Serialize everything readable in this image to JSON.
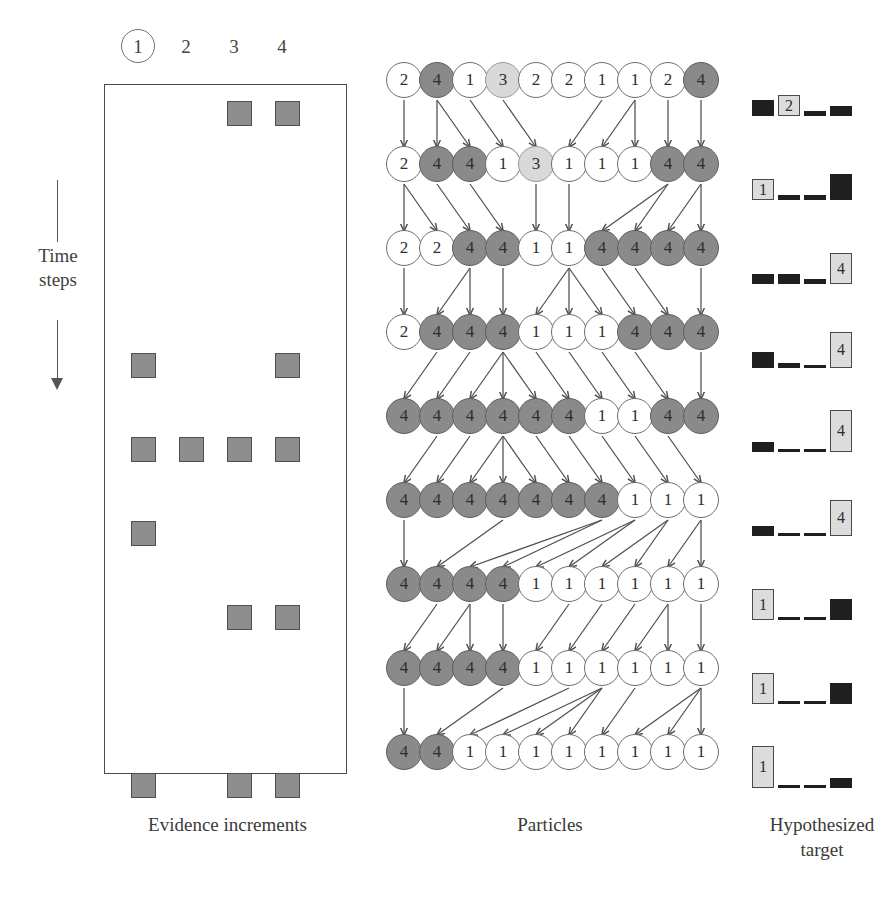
{
  "figure": {
    "columns": [
      {
        "label": "1",
        "circled": true
      },
      {
        "label": "2",
        "circled": false
      },
      {
        "label": "3",
        "circled": false
      },
      {
        "label": "4",
        "circled": false
      }
    ],
    "time_axis_label": "Time\nsteps",
    "time_axis_line1": "Time",
    "time_axis_line2": "steps",
    "captions": {
      "evidence": "Evidence increments",
      "particles": "Particles",
      "hypothesized": "Hypothesized target"
    },
    "colors": {
      "evidence_square_fill": "#8e8e8e",
      "evidence_square_border": "#4f4f4f",
      "particle_white": "#ffffff",
      "particle_dark": "#8a8a8a",
      "particle_light": "#d9d9d9",
      "bar_dark": "#1f1f1f",
      "bar_highlight": "#dcdcdc",
      "box_border": "#4a4a4a",
      "arrow": "#4f4f4f"
    }
  },
  "chart_data": {
    "type": "diagram",
    "n_time_steps": 9,
    "n_particles": 10,
    "n_targets": 4,
    "evidence_increments": {
      "description": "Grid of evidence increment marks; rows are time steps, columns are candidate targets 1-4",
      "columns": [
        "1",
        "2",
        "3",
        "4"
      ],
      "rows": [
        {
          "step": 1,
          "marks": [
            0,
            0,
            1,
            1
          ]
        },
        {
          "step": 2,
          "marks": [
            0,
            0,
            0,
            0
          ]
        },
        {
          "step": 3,
          "marks": [
            0,
            0,
            0,
            0
          ]
        },
        {
          "step": 4,
          "marks": [
            1,
            0,
            0,
            1
          ]
        },
        {
          "step": 5,
          "marks": [
            1,
            1,
            1,
            1
          ]
        },
        {
          "step": 6,
          "marks": [
            1,
            0,
            0,
            0
          ]
        },
        {
          "step": 7,
          "marks": [
            0,
            0,
            1,
            1
          ]
        },
        {
          "step": 8,
          "marks": [
            0,
            0,
            0,
            0
          ]
        },
        {
          "step": 9,
          "marks": [
            1,
            0,
            1,
            1
          ]
        }
      ]
    },
    "particles": {
      "description": "Each row is one time step of 10 particles, each labelled with its hypothesized target id",
      "rows": [
        {
          "step": 1,
          "values": [
            "2",
            "4",
            "1",
            "3",
            "2",
            "2",
            "1",
            "1",
            "2",
            "4"
          ]
        },
        {
          "step": 2,
          "values": [
            "2",
            "4",
            "4",
            "1",
            "3",
            "1",
            "1",
            "1",
            "4",
            "4"
          ]
        },
        {
          "step": 3,
          "values": [
            "2",
            "2",
            "4",
            "4",
            "1",
            "1",
            "4",
            "4",
            "4",
            "4"
          ]
        },
        {
          "step": 4,
          "values": [
            "2",
            "4",
            "4",
            "4",
            "1",
            "1",
            "1",
            "4",
            "4",
            "4"
          ]
        },
        {
          "step": 5,
          "values": [
            "4",
            "4",
            "4",
            "4",
            "4",
            "4",
            "1",
            "1",
            "4",
            "4"
          ]
        },
        {
          "step": 6,
          "values": [
            "4",
            "4",
            "4",
            "4",
            "4",
            "4",
            "4",
            "1",
            "1",
            "1"
          ]
        },
        {
          "step": 7,
          "values": [
            "4",
            "4",
            "4",
            "4",
            "1",
            "1",
            "1",
            "1",
            "1",
            "1"
          ]
        },
        {
          "step": 8,
          "values": [
            "4",
            "4",
            "4",
            "4",
            "1",
            "1",
            "1",
            "1",
            "1",
            "1"
          ]
        },
        {
          "step": 9,
          "values": [
            "4",
            "4",
            "1",
            "1",
            "1",
            "1",
            "1",
            "1",
            "1",
            "1"
          ]
        }
      ]
    },
    "hypothesized_target": {
      "description": "Per time step histogram over the 4 candidate targets; tallest bar is highlighted and labelled",
      "categories": [
        "1",
        "2",
        "3",
        "4"
      ],
      "ylim": [
        0,
        10
      ],
      "rows": [
        {
          "step": 1,
          "values": [
            3,
            4,
            1,
            2
          ],
          "argmax": "2"
        },
        {
          "step": 2,
          "values": [
            4,
            1,
            1,
            5
          ],
          "argmax": "1"
        },
        {
          "step": 3,
          "values": [
            2,
            2,
            1,
            6
          ],
          "argmax": "4"
        },
        {
          "step": 4,
          "values": [
            3,
            1,
            0,
            7
          ],
          "argmax": "4"
        },
        {
          "step": 5,
          "values": [
            2,
            0,
            0,
            8
          ],
          "argmax": "4"
        },
        {
          "step": 6,
          "values": [
            2,
            0,
            0,
            7
          ],
          "argmax": "4"
        },
        {
          "step": 7,
          "values": [
            6,
            0,
            0,
            4
          ],
          "argmax": "1"
        },
        {
          "step": 8,
          "values": [
            6,
            0,
            0,
            4
          ],
          "argmax": "1"
        },
        {
          "step": 9,
          "values": [
            8,
            0,
            0,
            2
          ],
          "argmax": "1"
        }
      ]
    },
    "resampling_arrows": {
      "description": "Arrows between consecutive particle rows showing resampling lineage (parent index -> child index, 0-based)",
      "transitions": [
        {
          "from_step": 1,
          "to_step": 2,
          "edges": [
            [
              0,
              0
            ],
            [
              1,
              1
            ],
            [
              1,
              2
            ],
            [
              2,
              3
            ],
            [
              3,
              4
            ],
            [
              6,
              5
            ],
            [
              7,
              6
            ],
            [
              7,
              7
            ],
            [
              8,
              8
            ],
            [
              9,
              9
            ]
          ]
        },
        {
          "from_step": 2,
          "to_step": 3,
          "edges": [
            [
              0,
              0
            ],
            [
              0,
              1
            ],
            [
              1,
              2
            ],
            [
              2,
              3
            ],
            [
              4,
              4
            ],
            [
              5,
              5
            ],
            [
              8,
              6
            ],
            [
              8,
              7
            ],
            [
              9,
              8
            ],
            [
              9,
              9
            ]
          ]
        },
        {
          "from_step": 3,
          "to_step": 4,
          "edges": [
            [
              0,
              0
            ],
            [
              2,
              1
            ],
            [
              2,
              2
            ],
            [
              3,
              3
            ],
            [
              5,
              4
            ],
            [
              5,
              5
            ],
            [
              5,
              6
            ],
            [
              6,
              7
            ],
            [
              7,
              8
            ],
            [
              9,
              9
            ]
          ]
        },
        {
          "from_step": 4,
          "to_step": 5,
          "edges": [
            [
              1,
              0
            ],
            [
              2,
              1
            ],
            [
              3,
              2
            ],
            [
              3,
              3
            ],
            [
              3,
              4
            ],
            [
              4,
              5
            ],
            [
              5,
              6
            ],
            [
              6,
              7
            ],
            [
              7,
              8
            ],
            [
              9,
              9
            ]
          ]
        },
        {
          "from_step": 5,
          "to_step": 6,
          "edges": [
            [
              1,
              0
            ],
            [
              2,
              1
            ],
            [
              3,
              2
            ],
            [
              3,
              3
            ],
            [
              3,
              4
            ],
            [
              4,
              5
            ],
            [
              5,
              6
            ],
            [
              6,
              7
            ],
            [
              7,
              8
            ],
            [
              8,
              9
            ]
          ]
        },
        {
          "from_step": 6,
          "to_step": 7,
          "edges": [
            [
              0,
              0
            ],
            [
              3,
              1
            ],
            [
              6,
              2
            ],
            [
              6,
              3
            ],
            [
              7,
              4
            ],
            [
              7,
              5
            ],
            [
              8,
              6
            ],
            [
              8,
              7
            ],
            [
              9,
              8
            ],
            [
              9,
              9
            ]
          ]
        },
        {
          "from_step": 7,
          "to_step": 8,
          "edges": [
            [
              1,
              0
            ],
            [
              2,
              1
            ],
            [
              2,
              2
            ],
            [
              3,
              3
            ],
            [
              5,
              4
            ],
            [
              6,
              5
            ],
            [
              7,
              6
            ],
            [
              8,
              7
            ],
            [
              8,
              8
            ],
            [
              9,
              9
            ]
          ]
        },
        {
          "from_step": 8,
          "to_step": 9,
          "edges": [
            [
              0,
              0
            ],
            [
              3,
              1
            ],
            [
              5,
              2
            ],
            [
              6,
              3
            ],
            [
              6,
              4
            ],
            [
              6,
              5
            ],
            [
              7,
              6
            ],
            [
              9,
              7
            ],
            [
              9,
              8
            ],
            [
              9,
              9
            ]
          ]
        }
      ]
    }
  }
}
